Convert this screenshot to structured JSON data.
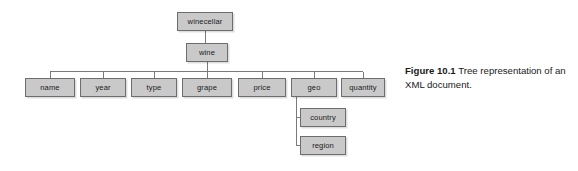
{
  "figure": {
    "label": "Figure 10.1",
    "caption": "Tree representation of an XML document."
  },
  "colors": {
    "node_fill": "#c9c9c9",
    "node_border": "#6d6d6d",
    "edge": "#7a7a7a",
    "text": "#1b1b1b",
    "background": "#ffffff"
  },
  "tree": {
    "root": {
      "label": "winecellar",
      "x": 177,
      "y": 12,
      "w": 56,
      "h": 19
    },
    "level1": {
      "label": "wine",
      "x": 186,
      "y": 43,
      "w": 42,
      "h": 19
    },
    "children": [
      {
        "label": "name",
        "x": 25,
        "y": 78,
        "w": 50,
        "h": 19
      },
      {
        "label": "year",
        "x": 80,
        "y": 78,
        "w": 46,
        "h": 19
      },
      {
        "label": "type",
        "x": 131,
        "y": 78,
        "w": 46,
        "h": 19
      },
      {
        "label": "grape",
        "x": 182,
        "y": 78,
        "w": 50,
        "h": 19
      },
      {
        "label": "price",
        "x": 238,
        "y": 78,
        "w": 48,
        "h": 19
      },
      {
        "label": "geo",
        "x": 291,
        "y": 78,
        "w": 46,
        "h": 19
      },
      {
        "label": "quantity",
        "x": 341,
        "y": 78,
        "w": 44,
        "h": 19
      }
    ],
    "geo_children": [
      {
        "label": "country",
        "x": 300,
        "y": 108,
        "w": 46,
        "h": 19
      },
      {
        "label": "region",
        "x": 300,
        "y": 136,
        "w": 46,
        "h": 19
      }
    ]
  }
}
